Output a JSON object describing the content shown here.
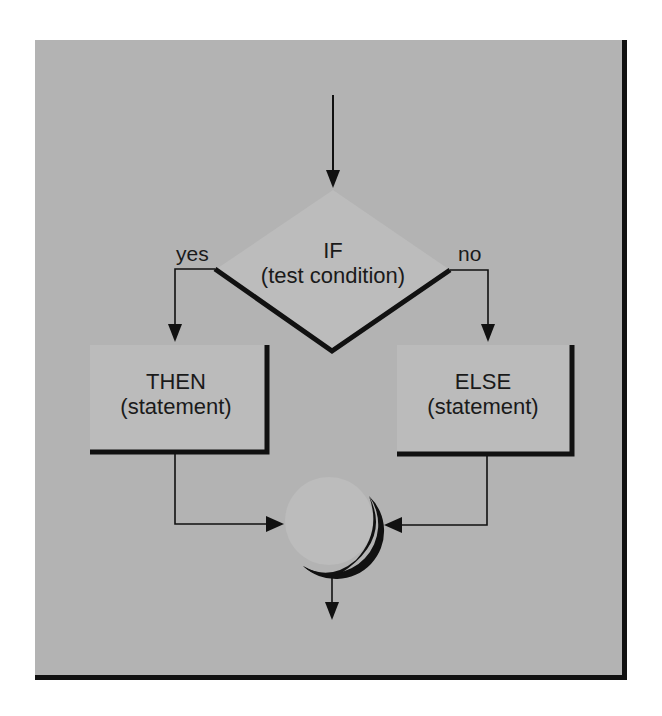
{
  "diagram": {
    "type": "flowchart",
    "colors": {
      "panel_bg": "#b3b3b3",
      "shape_fill": "#bcbcbc",
      "line": "#111111",
      "page_bg": "#ffffff"
    },
    "decision": {
      "title": "IF",
      "subtitle": "(test condition)"
    },
    "branches": {
      "yes_label": "yes",
      "no_label": "no"
    },
    "then_node": {
      "title": "THEN",
      "subtitle": "(statement)"
    },
    "else_node": {
      "title": "ELSE",
      "subtitle": "(statement)"
    },
    "connector": {
      "shape": "circle-merge-point"
    },
    "edges": [
      {
        "from": "entry",
        "to": "decision"
      },
      {
        "from": "decision",
        "to": "then_node",
        "label": "yes"
      },
      {
        "from": "decision",
        "to": "else_node",
        "label": "no"
      },
      {
        "from": "then_node",
        "to": "connector"
      },
      {
        "from": "else_node",
        "to": "connector"
      },
      {
        "from": "connector",
        "to": "exit"
      }
    ]
  }
}
